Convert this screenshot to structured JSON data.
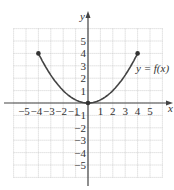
{
  "chart_data": {
    "type": "line",
    "title": "",
    "xlabel": "x",
    "ylabel": "y",
    "annotation": "y = f(x)",
    "xlim": [
      -6,
      6
    ],
    "ylim": [
      -6,
      6
    ],
    "grid": true,
    "x_ticks": [
      "-5",
      "-4",
      "-3",
      "-2",
      "-1",
      "1",
      "2",
      "3",
      "4",
      "5"
    ],
    "y_ticks": [
      "5",
      "4",
      "3",
      "2",
      "1",
      "-1",
      "-2",
      "-3",
      "-4",
      "-5"
    ],
    "series": [
      {
        "name": "y = f(x)",
        "function": "x^2/4",
        "domain": [
          -4,
          4
        ],
        "x": [
          -4,
          -3,
          -2,
          -1,
          0,
          1,
          2,
          3,
          4
        ],
        "y": [
          4,
          2.25,
          1,
          0.25,
          0,
          0.25,
          1,
          2.25,
          4
        ],
        "closed_endpoints": [
          [
            -4,
            4
          ],
          [
            4,
            4
          ]
        ],
        "marked_points": [
          [
            0,
            0
          ]
        ]
      }
    ]
  },
  "labels": {
    "x_axis": "x",
    "y_axis": "y",
    "curve": "y = f(x)"
  }
}
